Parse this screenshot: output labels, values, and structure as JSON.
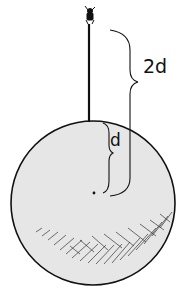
{
  "diagram": {
    "labels": {
      "two_d": "2d",
      "d": "d"
    },
    "colors": {
      "sphere_fill": "#e6e6e6",
      "ink": "#111111",
      "background": "#ffffff"
    },
    "elements": [
      "sphere",
      "pole",
      "figure-on-top",
      "center-point",
      "brace-d",
      "brace-2d",
      "hatching-shadow"
    ]
  }
}
